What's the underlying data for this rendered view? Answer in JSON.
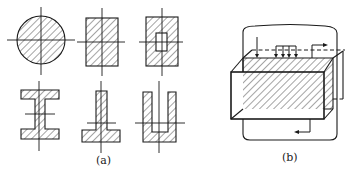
{
  "figure": {
    "panels": [
      {
        "id": "a",
        "caption": "(a)",
        "shapes": [
          "solid-circle",
          "solid-rectangle",
          "hollow-rectangle",
          "I-section",
          "inverted-T-section",
          "U-section"
        ]
      },
      {
        "id": "b",
        "caption": "(b)",
        "shapes": [
          "rectangular-prism-with-hatched-section",
          "flow-loop-with-arrows"
        ]
      }
    ],
    "colors": {
      "line": "#1a1a1a",
      "background": "#ffffff"
    }
  }
}
